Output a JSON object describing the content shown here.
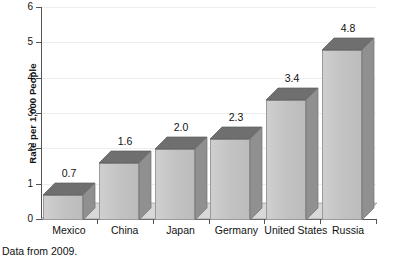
{
  "chart_data": {
    "type": "bar",
    "title": "",
    "subtitle": "",
    "xlabel": "",
    "ylabel": "Rate per 1,000 People",
    "ylim": [
      0,
      6
    ],
    "ytick_labels": [
      "0",
      "1",
      "2",
      "3",
      "4",
      "5",
      "6"
    ],
    "ytick_values": [
      0,
      1,
      2,
      3,
      4,
      5,
      6
    ],
    "grid": true,
    "legend": null,
    "categories": [
      "Mexico",
      "China",
      "Japan",
      "Germany",
      "United States",
      "Russia"
    ],
    "values": [
      0.7,
      1.6,
      2.0,
      2.3,
      3.4,
      4.8
    ],
    "data_labels": [
      "0.7",
      "1.6",
      "2.0",
      "2.3",
      "3.4",
      "4.8"
    ],
    "annotation": "Data from 2009.",
    "style": "3d-bars"
  },
  "colors": {
    "bar_front": "#c4c4c4",
    "bar_top": "#6f6f6f",
    "bar_side": "#909090",
    "floor": "#d6d6d6",
    "axis": "#555555",
    "gridline": "#ededed",
    "text": "#111111",
    "background": "#ffffff"
  },
  "caption": {
    "text": "Data from 2009."
  }
}
